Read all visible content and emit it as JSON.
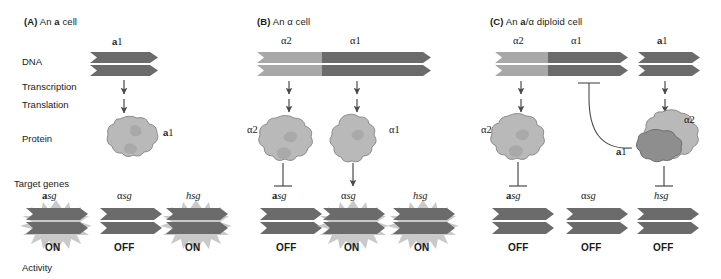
{
  "figure": {
    "row_labels": [
      {
        "id": "dna",
        "text": "DNA"
      },
      {
        "id": "transcription",
        "text": "Transcription"
      },
      {
        "id": "translation",
        "text": "Translation"
      },
      {
        "id": "protein",
        "text": "Protein"
      },
      {
        "id": "target-genes",
        "text": "Target genes"
      },
      {
        "id": "activity",
        "text": "Activity"
      }
    ],
    "colors": {
      "gene_dark": "#6b6b6b",
      "gene_light": "#a8a8a8",
      "protein_light": "#b9b9b9",
      "protein_dark": "#8e8e8e",
      "starburst": "#c9c9c9",
      "line": "#4a4a4a",
      "text": "#1a1a1a",
      "background": "#ffffff"
    }
  },
  "panels": [
    {
      "id": "panel-a",
      "tag": "(A)",
      "title_prefix": "An ",
      "title_bold": "a",
      "title_suffix": " cell",
      "genes": [
        {
          "id": "a1",
          "label_bold": "a",
          "label_rest": "1",
          "shade": "dark"
        }
      ],
      "proteins": [
        {
          "id": "a1-protein",
          "label_bold": "a",
          "label_rest": "1",
          "type": "monomer"
        }
      ],
      "targets": [
        {
          "id": "asg",
          "label_bold": "a",
          "label_rest": "sg",
          "greek": "",
          "state": "ON"
        },
        {
          "id": "alsg",
          "label_bold": "",
          "label_rest": "sg",
          "greek": "α",
          "state": "OFF"
        },
        {
          "id": "hsg",
          "label_bold": "",
          "label_rest": "hsg",
          "greek": "",
          "state": "ON"
        }
      ]
    },
    {
      "id": "panel-b",
      "tag": "(B)",
      "title_prefix": "An ",
      "title_bold": "α",
      "title_suffix": " cell",
      "genes": [
        {
          "id": "alpha2",
          "label_bold": "",
          "label_rest": "α2",
          "shade": "light"
        },
        {
          "id": "alpha1",
          "label_bold": "",
          "label_rest": "α1",
          "shade": "dark"
        }
      ],
      "proteins": [
        {
          "id": "alpha2-protein",
          "label_bold": "",
          "label_rest": "α2",
          "type": "monomer"
        },
        {
          "id": "alpha1-protein",
          "label_bold": "",
          "label_rest": "α1",
          "type": "monomer"
        }
      ],
      "targets": [
        {
          "id": "asg",
          "label_bold": "a",
          "label_rest": "sg",
          "greek": "",
          "state": "OFF"
        },
        {
          "id": "alsg",
          "label_bold": "",
          "label_rest": "sg",
          "greek": "α",
          "state": "ON"
        },
        {
          "id": "hsg",
          "label_bold": "",
          "label_rest": "hsg",
          "greek": "",
          "state": "ON"
        }
      ]
    },
    {
      "id": "panel-c",
      "tag": "(C)",
      "title_prefix": "An ",
      "title_bold": "a",
      "title_mid": "/α",
      "title_suffix": " diploid cell",
      "genes": [
        {
          "id": "alpha2",
          "label_bold": "",
          "label_rest": "α2",
          "shade": "light"
        },
        {
          "id": "alpha1",
          "label_bold": "",
          "label_rest": "α1",
          "shade": "dark"
        },
        {
          "id": "a1",
          "label_bold": "a",
          "label_rest": "1",
          "shade": "dark"
        }
      ],
      "proteins": [
        {
          "id": "alpha2-protein",
          "label_bold": "",
          "label_rest": "α2",
          "type": "monomer"
        },
        {
          "id": "a1-alpha2-complex",
          "label_bold": "a",
          "label_rest": "1",
          "label2": "α2",
          "type": "heterodimer"
        }
      ],
      "targets": [
        {
          "id": "asg",
          "label_bold": "a",
          "label_rest": "sg",
          "greek": "",
          "state": "OFF"
        },
        {
          "id": "alsg",
          "label_bold": "",
          "label_rest": "sg",
          "greek": "α",
          "state": "OFF"
        },
        {
          "id": "hsg",
          "label_bold": "",
          "label_rest": "hsg",
          "greek": "",
          "state": "OFF"
        }
      ]
    }
  ]
}
